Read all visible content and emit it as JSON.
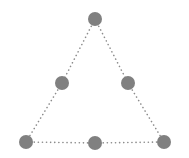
{
  "figure": {
    "kind": "graph-diagram",
    "width": 189,
    "height": 158,
    "background_color": "#ffffff"
  },
  "style": {
    "node_color": "#808080",
    "node_radius": 7,
    "edge_color": "#8c8c8c",
    "edge_width": 1.6,
    "edge_style": "dotted",
    "edge_dash_pattern": "0.1 4"
  },
  "chart_data": {
    "type": "scatter",
    "xlabel": "",
    "ylabel": "",
    "grid": false,
    "legend": "none",
    "nodes": [
      {
        "id": "apex",
        "label": "",
        "x": 95,
        "y": 19,
        "r": 7,
        "color": "#808080"
      },
      {
        "id": "left-mid",
        "label": "",
        "x": 62,
        "y": 83,
        "r": 7,
        "color": "#808080"
      },
      {
        "id": "right-mid",
        "label": "",
        "x": 128,
        "y": 83,
        "r": 7,
        "color": "#808080"
      },
      {
        "id": "bottom-left",
        "label": "",
        "x": 26,
        "y": 142,
        "r": 7,
        "color": "#808080"
      },
      {
        "id": "bottom-mid",
        "label": "",
        "x": 95,
        "y": 143,
        "r": 7,
        "color": "#808080"
      },
      {
        "id": "bottom-right",
        "label": "",
        "x": 164,
        "y": 142,
        "r": 7,
        "color": "#808080"
      }
    ],
    "edges": [
      {
        "id": "edge-apex-left-mid",
        "from": "apex",
        "to": "left-mid",
        "x1": 95,
        "y1": 19,
        "x2": 62,
        "y2": 83
      },
      {
        "id": "edge-left-mid-bottom-left",
        "from": "left-mid",
        "to": "bottom-left",
        "x1": 62,
        "y1": 83,
        "x2": 26,
        "y2": 142
      },
      {
        "id": "edge-apex-right-mid",
        "from": "apex",
        "to": "right-mid",
        "x1": 95,
        "y1": 19,
        "x2": 128,
        "y2": 83
      },
      {
        "id": "edge-right-mid-bottom-right",
        "from": "right-mid",
        "to": "bottom-right",
        "x1": 128,
        "y1": 83,
        "x2": 164,
        "y2": 142
      },
      {
        "id": "edge-bottom-left-bottom-mid",
        "from": "bottom-left",
        "to": "bottom-mid",
        "x1": 26,
        "y1": 142,
        "x2": 95,
        "y2": 143
      },
      {
        "id": "edge-bottom-mid-bottom-right",
        "from": "bottom-mid",
        "to": "bottom-right",
        "x1": 95,
        "y1": 143,
        "x2": 164,
        "y2": 142
      }
    ]
  }
}
